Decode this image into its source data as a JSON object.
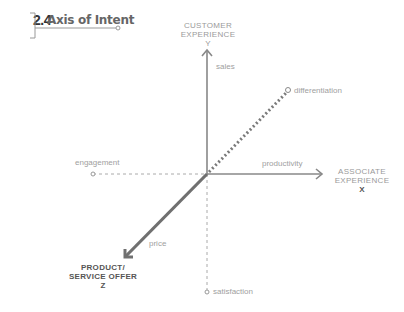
{
  "header": {
    "section_number": "2.4",
    "section_title": "Axis of Intent"
  },
  "diagram": {
    "axes": {
      "y": {
        "title_line1": "CUSTOMER",
        "title_line2": "EXPERIENCE",
        "letter": "Y"
      },
      "x": {
        "title_line1": "ASSOCIATE",
        "title_line2": "EXPERIENCE",
        "letter": "X"
      },
      "z": {
        "title_line1": "PRODUCT/",
        "title_line2": "SERVICE OFFER",
        "letter": "Z"
      }
    },
    "labels": {
      "sales": "sales",
      "differentiation": "differentiation",
      "engagement": "engagement",
      "productivity": "productivity",
      "price": "price",
      "satisfaction": "satisfaction"
    },
    "colors": {
      "axis": "#888888",
      "z_axis": "#707070",
      "dotted": "#7a7a7a",
      "dashed": "#aaaaaa",
      "text_light": "#a0a0a0",
      "text_dark": "#555555"
    }
  }
}
